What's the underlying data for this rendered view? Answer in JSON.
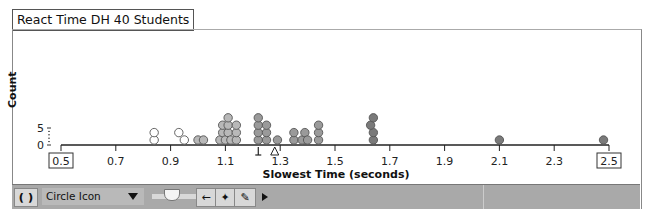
{
  "title": "React Time DH 40 Students",
  "chart_data": {
    "type": "scatter",
    "subtype": "dot_plot",
    "title": "React Time DH 40 Students",
    "xlabel": "Slowest Time (seconds)",
    "ylabel": "Count",
    "xlim": [
      0.5,
      2.5
    ],
    "x_ticks": [
      "0.5",
      "0.7",
      "0.9",
      "1.1",
      "1.3",
      "1.5",
      "1.7",
      "1.9",
      "2.1",
      "2.3",
      "2.5"
    ],
    "y_ticks": [
      "0",
      "5"
    ],
    "markers": {
      "median_marker_x": 1.22,
      "mean_marker_x": 1.28
    },
    "points": [
      {
        "x": 0.84,
        "level": 0,
        "shade": "white"
      },
      {
        "x": 0.84,
        "level": 1,
        "shade": "white"
      },
      {
        "x": 0.93,
        "level": 1,
        "shade": "white"
      },
      {
        "x": 0.95,
        "level": 0,
        "shade": "white"
      },
      {
        "x": 1.0,
        "level": 0,
        "shade": "light"
      },
      {
        "x": 1.02,
        "level": 0,
        "shade": "light"
      },
      {
        "x": 1.08,
        "level": 0,
        "shade": "light"
      },
      {
        "x": 1.09,
        "level": 1,
        "shade": "light"
      },
      {
        "x": 1.09,
        "level": 2,
        "shade": "light"
      },
      {
        "x": 1.1,
        "level": 0,
        "shade": "light"
      },
      {
        "x": 1.11,
        "level": 1,
        "shade": "light"
      },
      {
        "x": 1.11,
        "level": 2,
        "shade": "light"
      },
      {
        "x": 1.11,
        "level": 3,
        "shade": "light"
      },
      {
        "x": 1.12,
        "level": 0,
        "shade": "light"
      },
      {
        "x": 1.14,
        "level": 0,
        "shade": "light"
      },
      {
        "x": 1.14,
        "level": 1,
        "shade": "light"
      },
      {
        "x": 1.14,
        "level": 2,
        "shade": "light"
      },
      {
        "x": 1.22,
        "level": 0,
        "shade": "mid"
      },
      {
        "x": 1.22,
        "level": 1,
        "shade": "mid"
      },
      {
        "x": 1.22,
        "level": 2,
        "shade": "mid"
      },
      {
        "x": 1.22,
        "level": 3,
        "shade": "mid"
      },
      {
        "x": 1.25,
        "level": 0,
        "shade": "mid"
      },
      {
        "x": 1.25,
        "level": 1,
        "shade": "mid"
      },
      {
        "x": 1.25,
        "level": 2,
        "shade": "mid"
      },
      {
        "x": 1.29,
        "level": 0,
        "shade": "mid"
      },
      {
        "x": 1.35,
        "level": 0,
        "shade": "mid"
      },
      {
        "x": 1.35,
        "level": 1,
        "shade": "mid"
      },
      {
        "x": 1.38,
        "level": 0,
        "shade": "mid"
      },
      {
        "x": 1.39,
        "level": 1,
        "shade": "mid"
      },
      {
        "x": 1.4,
        "level": 0,
        "shade": "mid"
      },
      {
        "x": 1.44,
        "level": 0,
        "shade": "mid"
      },
      {
        "x": 1.44,
        "level": 1,
        "shade": "mid"
      },
      {
        "x": 1.44,
        "level": 2,
        "shade": "mid"
      },
      {
        "x": 1.64,
        "level": 0,
        "shade": "dark"
      },
      {
        "x": 1.64,
        "level": 1,
        "shade": "dark"
      },
      {
        "x": 1.63,
        "level": 2,
        "shade": "dark"
      },
      {
        "x": 1.64,
        "level": 3,
        "shade": "dark"
      },
      {
        "x": 2.1,
        "level": 0,
        "shade": "dark"
      },
      {
        "x": 2.48,
        "level": 0,
        "shade": "dark"
      }
    ]
  },
  "toolbar": {
    "rotate_icon": "rotate-arrows-icon",
    "select_value": "Circle Icon",
    "slider_icon": "slider-thumb",
    "back_icon": "left-arrow-icon",
    "plus_icon": "plus-icon",
    "pencil_icon": "pencil-icon",
    "play_icon": "play-triangle-icon"
  },
  "colors": {
    "white": "#ffffff",
    "light": "#b8b8b8",
    "mid": "#9a9a9a",
    "dark": "#7a7a7a",
    "toolbar": "#a9a9a9"
  }
}
